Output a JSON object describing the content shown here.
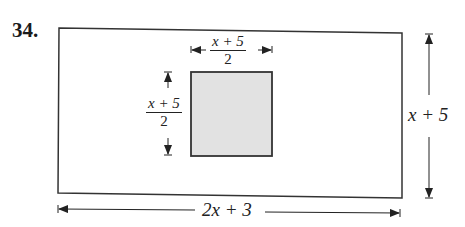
{
  "problem_number": "34.",
  "outer_rectangle": {
    "width_label": "2x + 3",
    "height_label": "x + 5",
    "fill": "#ffffff",
    "stroke": "#333333"
  },
  "inner_square": {
    "width_label": {
      "numerator": "x + 5",
      "denominator": "2"
    },
    "height_label": {
      "numerator": "x + 5",
      "denominator": "2"
    },
    "fill": "#e2e2e2",
    "stroke": "#333333"
  }
}
